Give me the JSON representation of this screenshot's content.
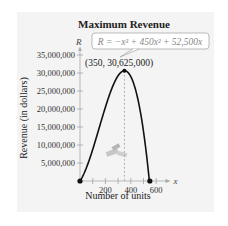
{
  "chart_data": {
    "type": "line",
    "title": "Maximum Revenue",
    "xlabel": "Number of units",
    "ylabel": "Revenue (in dollars)",
    "x_axis_var": "x",
    "y_axis_var": "R",
    "xlim": [
      0,
      650
    ],
    "ylim": [
      0,
      37000000
    ],
    "x_ticks": [
      100,
      200,
      300,
      400,
      500,
      600
    ],
    "x_tick_labels": [
      {
        "value": 200,
        "label": "200"
      },
      {
        "value": 400,
        "label": "400"
      },
      {
        "value": 600,
        "label": "600"
      }
    ],
    "y_ticks": [
      {
        "value": 5000000,
        "label": "5,000,000"
      },
      {
        "value": 10000000,
        "label": "10,000,000"
      },
      {
        "value": 15000000,
        "label": "15,000,000"
      },
      {
        "value": 20000000,
        "label": "20,000,000"
      },
      {
        "value": 25000000,
        "label": "25,000,000"
      },
      {
        "value": 30000000,
        "label": "30,000,000"
      },
      {
        "value": 35000000,
        "label": "35,000,000"
      }
    ],
    "series": [
      {
        "name": "R = -x^3 + 450x^2 + 52,500x",
        "function": {
          "cubic": -1,
          "quadratic": 450,
          "linear": 52500,
          "constant": 0
        },
        "domain": [
          0,
          550
        ]
      }
    ],
    "points": [
      {
        "x": 0,
        "y": 0
      },
      {
        "x": 350,
        "y": 30625000,
        "label": "(350, 30,625,000)"
      },
      {
        "x": 550,
        "y": 0
      }
    ],
    "annotations": [
      {
        "text": "R = −x³ + 450x² + 52,500x",
        "type": "equation-callout"
      },
      {
        "text": "(350, 30,625,000)",
        "type": "point-label"
      }
    ],
    "grid": false,
    "legend": "none"
  }
}
